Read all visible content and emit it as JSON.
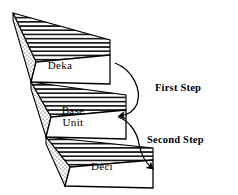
{
  "figure": {
    "background_color": "#ffffff",
    "line_color": "#000000"
  },
  "steps": [
    {
      "id": "deka",
      "label": "Deka",
      "level": 1,
      "top_face_fill": "horizontal-hatch",
      "left_face_fill": "stipple-dots",
      "front_face_fill": "#ffffff"
    },
    {
      "id": "base-unit",
      "label": "Base\nUnit",
      "label_line1": "Base",
      "label_line2": "Unit",
      "level": 2,
      "top_face_fill": "horizontal-hatch",
      "left_face_fill": "stipple-dots",
      "front_face_fill": "#ffffff"
    },
    {
      "id": "deci",
      "label": "Deci",
      "level": 3,
      "top_face_fill": "horizontal-hatch",
      "left_face_fill": "stipple-dots",
      "front_face_fill": "#ffffff"
    }
  ],
  "annotations": [
    {
      "id": "first-step",
      "label": "First Step",
      "arrow": "curved-arrow-down-left",
      "from_step": "deka",
      "to_step": "base-unit"
    },
    {
      "id": "second-step",
      "label": "Second Step",
      "arrow": "curved-arrow-down-left",
      "from_step": "base-unit",
      "to_step": "deci"
    }
  ]
}
